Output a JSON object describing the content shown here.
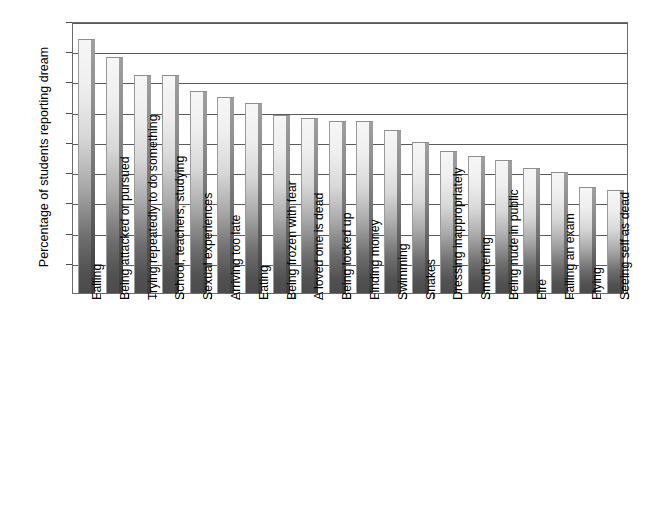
{
  "chart_data": {
    "type": "bar",
    "title": "",
    "xlabel": "",
    "ylabel": "Percentage of students reporting dream",
    "ylim": [
      0,
      90
    ],
    "yticks": [
      10,
      20,
      30,
      40,
      50,
      60,
      70,
      80,
      90
    ],
    "grid": true,
    "legend": "none",
    "categories": [
      "Falling",
      "Being attacked or pursued",
      "Trying repeatedly to do something",
      "School, teachers, studying",
      "Sexual experiences",
      "Arriving too late",
      "Eating",
      "Being frozen with fear",
      "A loved one is dead",
      "Being locked up",
      "Finding money",
      "Swimming",
      "Snakes",
      "Dressing inappropriately",
      "Smothering",
      "Being nude in public",
      "Fire",
      "Failing an exam",
      "Flying",
      "Seeing self as dead"
    ],
    "values": [
      84,
      78,
      72,
      72,
      67,
      65,
      63,
      59,
      58,
      57,
      57,
      54,
      50,
      47,
      45.5,
      44,
      41.5,
      40,
      35,
      34
    ]
  },
  "axis": {
    "y_title": "Percentage of students reporting dream"
  },
  "caption": {
    "ghost_line": ""
  }
}
